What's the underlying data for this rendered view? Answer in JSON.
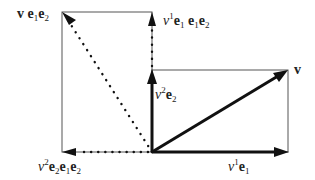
{
  "diagram": {
    "colors": {
      "stroke": "#111111",
      "thin": "#333333",
      "background": "#ffffff"
    },
    "origin": [
      152,
      152
    ],
    "vectors": [
      {
        "name": "v1-e1",
        "from": [
          152,
          152
        ],
        "to": [
          288,
          152
        ],
        "style": "solid-thick",
        "label": "v¹ e₁"
      },
      {
        "name": "v2-e2",
        "from": [
          152,
          152
        ],
        "to": [
          152,
          70
        ],
        "style": "solid-thick",
        "label": "v² e₂"
      },
      {
        "name": "v",
        "from": [
          152,
          152
        ],
        "to": [
          288,
          70
        ],
        "style": "solid-thick",
        "label": "v"
      },
      {
        "name": "v-e1e2",
        "from": [
          152,
          152
        ],
        "to": [
          62,
          12
        ],
        "style": "dotted",
        "label": "v e₁e₂"
      },
      {
        "name": "v1-e1-e1e2",
        "from": [
          152,
          70
        ],
        "to": [
          152,
          12
        ],
        "style": "dotted",
        "label": "v¹ e₁ e₁e₂"
      },
      {
        "name": "v2-e2-e1e2",
        "from": [
          152,
          152
        ],
        "to": [
          62,
          152
        ],
        "style": "dotted",
        "label": "v² e₂ e₁e₂"
      }
    ],
    "rectangles": [
      {
        "name": "v-parallelogram",
        "x": 152,
        "y": 70,
        "w": 136,
        "h": 82
      },
      {
        "name": "rotated-parallelogram",
        "x": 62,
        "y": 12,
        "w": 90,
        "h": 140
      }
    ]
  },
  "labels": {
    "v": "v",
    "v_e1e2": {
      "v": "v",
      "e1": "e",
      "s1": "1",
      "e2": "e",
      "s2": "2"
    },
    "v1_e1_e1e2": {
      "coef": "v",
      "sup": "1",
      "parts": [
        "e",
        "1",
        "e",
        "1",
        "e",
        "2"
      ]
    },
    "v2_e2": {
      "coef": "v",
      "sup": "2",
      "e": "e",
      "sub": "2"
    },
    "v2_e2_e1e2": {
      "coef": "v",
      "sup": "2",
      "parts": [
        "e",
        "2",
        "e",
        "1",
        "e",
        "2"
      ]
    },
    "v1_e1": {
      "coef": "v",
      "sup": "1",
      "e": "e",
      "sub": "1"
    }
  }
}
